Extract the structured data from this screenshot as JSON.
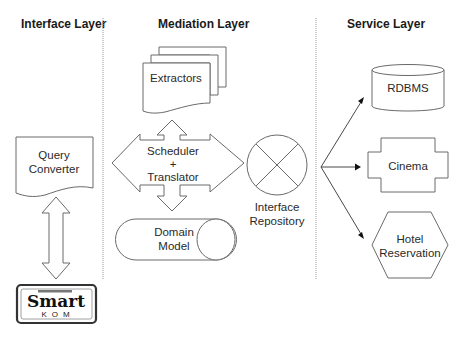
{
  "layers": {
    "interface": {
      "title": "Interface Layer"
    },
    "mediation": {
      "title": "Mediation Layer"
    },
    "service": {
      "title": "Service Layer"
    }
  },
  "interface_layer": {
    "query_converter": {
      "line1": "Query",
      "line2": "Converter"
    },
    "logo": {
      "top_text": "Smart",
      "bottom_text": "KOM"
    }
  },
  "mediation_layer": {
    "extractors": {
      "label": "Extractors"
    },
    "scheduler": {
      "line1": "Scheduler",
      "line2": "+",
      "line3": "Translator"
    },
    "domain_model": {
      "line1": "Domain",
      "line2": "Model"
    },
    "interface_repository": {
      "line1": "Interface",
      "line2": "Repository"
    }
  },
  "service_layer": {
    "rdbms": {
      "label": "RDBMS"
    },
    "cinema": {
      "label": "Cinema"
    },
    "hotel": {
      "line1": "Hotel",
      "line2": "Reservation"
    }
  },
  "colors": {
    "stroke": "#6a6a6a",
    "divider": "#9a9a9a",
    "text": "#2a2a2a",
    "arrow": "#111111"
  }
}
